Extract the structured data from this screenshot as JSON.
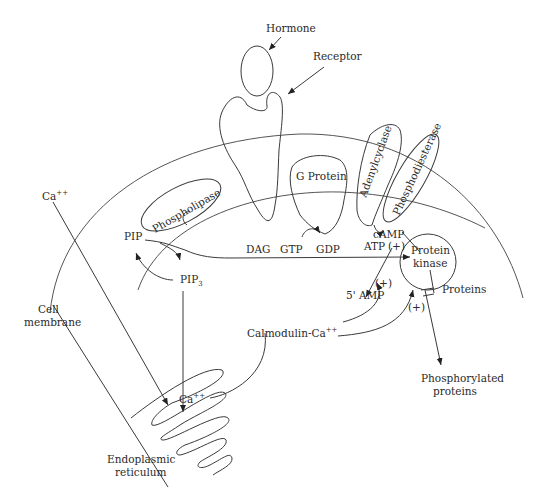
{
  "diagram": {
    "type": "cell-signaling-pathway",
    "labels": {
      "hormone": "Hormone",
      "receptor": "Receptor",
      "g_protein": "G Protein",
      "adenylcyclase": "Adenylcyclase",
      "phosphodiesterase": "Phosphodiesterase",
      "phospholipase": "Phospholipase",
      "ca_outside": "Ca",
      "ca_outside_sup": "++",
      "pip": "PIP",
      "pip3": "PIP",
      "pip3_sub": "3",
      "dag": "DAG",
      "gtp": "GTP",
      "gdp": "GDP",
      "camp": "cAMP",
      "atp": "ATP",
      "plus1": "(+)",
      "plus2": "(+)",
      "plus3": "(+)",
      "protein_kinase_line1": "Protein",
      "protein_kinase_line2": "kinase",
      "amp5": "5' AMP",
      "proteins": "Proteins",
      "cell_membrane_line1": "Cell",
      "cell_membrane_line2": "membrane",
      "calmodulin": "Calmodulin-Ca",
      "calmodulin_sup": "++",
      "ca_er": "Ca",
      "ca_er_sup": "++",
      "phosphorylated_line1": "Phosphorylated",
      "phosphorylated_line2": "proteins",
      "er_line1": "Endoplasmic",
      "er_line2": "reticulum"
    },
    "colors": {
      "background": "#ffffff",
      "line": "#3a3a3a",
      "text": "#2a2a2a"
    }
  }
}
